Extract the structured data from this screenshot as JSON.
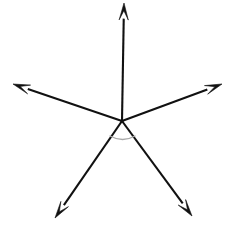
{
  "figure": {
    "kind": "geometry-diagram",
    "background_color": "#ffffff",
    "stroke_color": "#111111",
    "arc_color": "#a9a9a9",
    "stroke_width": 2.1,
    "canvas": {
      "width": 231,
      "height": 225
    },
    "vertex": {
      "x": 122,
      "y": 121,
      "label": ""
    },
    "rays": [
      {
        "name": "ray-up",
        "direction": "up",
        "tip": {
          "x": 124,
          "y": 3
        },
        "from": {
          "x": 122,
          "y": 121
        },
        "arrowhead": true,
        "label": ""
      },
      {
        "name": "ray-upper-left",
        "direction": "upper-left",
        "tip": {
          "x": 13,
          "y": 84
        },
        "from": {
          "x": 122,
          "y": 121
        },
        "arrowhead": true,
        "label": ""
      },
      {
        "name": "ray-upper-right",
        "direction": "upper-right",
        "tip": {
          "x": 222,
          "y": 84
        },
        "from": {
          "x": 122,
          "y": 121
        },
        "arrowhead": true,
        "label": ""
      },
      {
        "name": "ray-lower-left",
        "direction": "lower-left",
        "tip": {
          "x": 55,
          "y": 218
        },
        "from": {
          "x": 122,
          "y": 121
        },
        "arrowhead": true,
        "label": ""
      },
      {
        "name": "ray-lower-right",
        "direction": "lower-right",
        "tip": {
          "x": 192,
          "y": 216
        },
        "from": {
          "x": 122,
          "y": 121
        },
        "arrowhead": true,
        "label": ""
      }
    ],
    "angle_arc": {
      "name": "angle-arc-bottom",
      "between": [
        "ray-lower-left",
        "ray-lower-right"
      ],
      "start": {
        "x": 110,
        "y": 136
      },
      "end": {
        "x": 135,
        "y": 136
      },
      "radius": 19,
      "label": ""
    },
    "labels": []
  }
}
